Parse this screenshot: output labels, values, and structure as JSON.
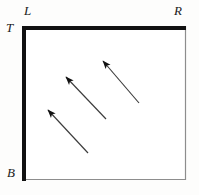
{
  "figure": {
    "background_color": "#fdfdfc",
    "labels": {
      "top_left": "L",
      "top_right": "R",
      "left_top": "T",
      "left_bottom": "B"
    },
    "rectangle": {
      "x": 22,
      "y": 26,
      "width": 164,
      "height": 154,
      "edges": {
        "top": {
          "name": "top-edge",
          "thickness": 4,
          "color": "#111111",
          "style": "thick"
        },
        "left": {
          "name": "left-edge",
          "thickness": 4,
          "color": "#111111",
          "style": "thick"
        },
        "right": {
          "name": "right-edge",
          "thickness": 1,
          "color": "#8d8d8d",
          "style": "thin"
        },
        "bottom": {
          "name": "bottom-edge",
          "thickness": 1,
          "color": "#8d8d8d",
          "style": "thin"
        }
      }
    },
    "arrows": {
      "count": 3,
      "color": "#3b3b3b",
      "head_color": "#111111",
      "direction": "up-left",
      "items": [
        {
          "name": "arrow-lower-left",
          "x1": 88,
          "y1": 153,
          "x2": 48,
          "y2": 110
        },
        {
          "name": "arrow-middle",
          "x1": 106,
          "y1": 119,
          "x2": 66,
          "y2": 77
        },
        {
          "name": "arrow-upper-right",
          "x1": 139,
          "y1": 103,
          "x2": 103,
          "y2": 61
        }
      ]
    }
  }
}
